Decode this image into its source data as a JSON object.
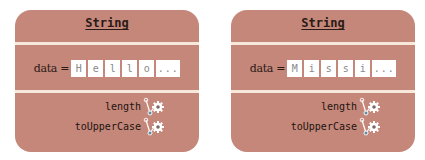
{
  "colors": {
    "card_fill": "#c4877a",
    "divider": "#f6e9dc",
    "box_fill": "#ffffff",
    "text_dark": "#2a1a16",
    "box_text": "#8a8a8a"
  },
  "cards": [
    {
      "title": "String",
      "data_label": "data =",
      "chars": [
        "H",
        "e",
        "l",
        "l",
        "o"
      ],
      "ellipsis": "...",
      "methods": [
        {
          "label": "length",
          "icon": "gear-lever-icon"
        },
        {
          "label": "toUpperCase",
          "icon": "gear-lever-icon"
        }
      ]
    },
    {
      "title": "String",
      "data_label": "data =",
      "chars": [
        "M",
        "i",
        "s",
        "s",
        "i"
      ],
      "ellipsis": "...",
      "methods": [
        {
          "label": "length",
          "icon": "gear-lever-icon"
        },
        {
          "label": "toUpperCase",
          "icon": "gear-lever-icon"
        }
      ]
    }
  ]
}
